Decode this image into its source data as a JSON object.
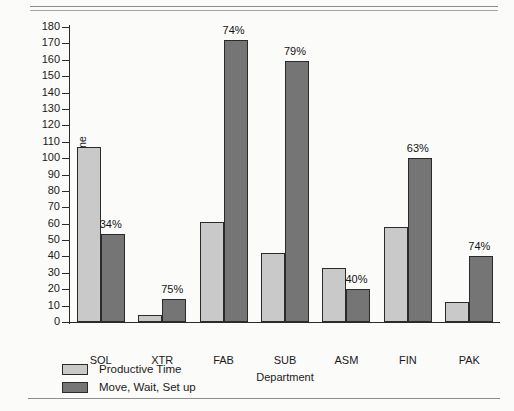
{
  "chart_data": {
    "type": "bar",
    "title": "",
    "xlabel": "Department",
    "ylabel": "Average Flow Time",
    "ylim": [
      0,
      180
    ],
    "ytick_step": 10,
    "grid": false,
    "legend_position": "bottom-left",
    "categories": [
      "SOL",
      "XTR",
      "FAB",
      "SUB",
      "ASM",
      "FIN",
      "PAK"
    ],
    "yticks": [
      "0",
      "10",
      "20",
      "30",
      "40",
      "50",
      "60",
      "70",
      "80",
      "90",
      "100",
      "110",
      "120",
      "130",
      "140",
      "150",
      "160",
      "170",
      "180"
    ],
    "series": [
      {
        "name": "Productive Time",
        "color": "#c9c9c9",
        "values": [
          107,
          4,
          61,
          42,
          33,
          58,
          12
        ]
      },
      {
        "name": "Move, Wait, Set up",
        "color": "#757575",
        "values": [
          54,
          14,
          172,
          159,
          20,
          100,
          40
        ]
      }
    ],
    "annotations": [
      "34%",
      "75%",
      "74%",
      "79%",
      "40%",
      "63%",
      "74%"
    ]
  },
  "colors": {
    "background": "#fbfbfa",
    "axis": "#2b2b2b",
    "text": "#1a1a1a",
    "series_light": "#c9c9c9",
    "series_dark": "#757575"
  }
}
